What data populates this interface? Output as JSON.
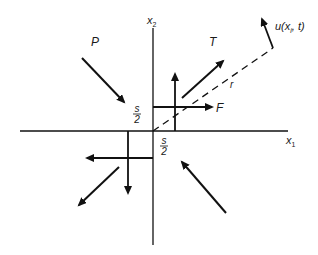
{
  "diagram": {
    "axes": {
      "x1_label": "x",
      "x1_sub": "1",
      "x2_label": "x",
      "x2_sub": "2"
    },
    "labels": {
      "P": "P",
      "T": "T",
      "F": "F",
      "r": "r",
      "u_main": "u(x",
      "u_sub": "i",
      "u_tail": ", t)",
      "half_s_upper_num": "s",
      "half_s_upper_den": "2",
      "half_s_lower_num": "s",
      "half_s_lower_den": "2"
    },
    "colors": {
      "stroke": "#111111",
      "text": "#1a1a1a",
      "background": "#ffffff"
    }
  }
}
